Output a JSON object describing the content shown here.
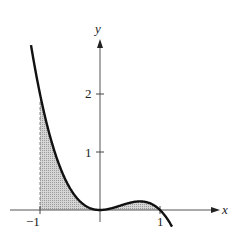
{
  "chart_data": {
    "type": "area",
    "title": "",
    "function": "y = x^2 - x^3",
    "xlabel": "x",
    "ylabel": "y",
    "xlim": [
      -1.25,
      1.25
    ],
    "ylim": [
      -0.3,
      2.9
    ],
    "x_ticks": [
      -1,
      1
    ],
    "x_tick_labels": [
      "−1",
      "1"
    ],
    "y_ticks": [
      1,
      2
    ],
    "y_tick_labels": [
      "1",
      "2"
    ],
    "shaded_region": {
      "from": -1,
      "to": 1,
      "description": "area between curve and x-axis"
    },
    "x": [
      -1.15,
      -1,
      -0.75,
      -0.5,
      -0.25,
      0,
      0.25,
      0.5,
      0.667,
      0.75,
      1,
      1.2
    ],
    "values": [
      2.84,
      2.0,
      0.98,
      0.375,
      0.078,
      0,
      0.047,
      0.125,
      0.148,
      0.141,
      0,
      -0.288
    ],
    "grid": false,
    "legend": null
  },
  "labels": {
    "x_axis": "x",
    "y_axis": "y",
    "tick_neg1": "−1",
    "tick_1": "1",
    "ytick_1": "1",
    "ytick_2": "2"
  }
}
